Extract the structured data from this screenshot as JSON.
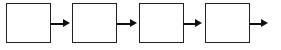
{
  "diagram": {
    "type": "flow",
    "nodes": [
      {
        "id": "box-1",
        "label": ""
      },
      {
        "id": "box-2",
        "label": ""
      },
      {
        "id": "box-3",
        "label": ""
      },
      {
        "id": "box-4",
        "label": ""
      }
    ],
    "edges": [
      {
        "from": "box-1",
        "to": "box-2"
      },
      {
        "from": "box-2",
        "to": "box-3"
      },
      {
        "from": "box-3",
        "to": "box-4"
      },
      {
        "from": "box-4",
        "to": ""
      }
    ],
    "colors": {
      "stroke": "#222222",
      "fill": "#ffffff",
      "arrow": "#111111"
    }
  }
}
